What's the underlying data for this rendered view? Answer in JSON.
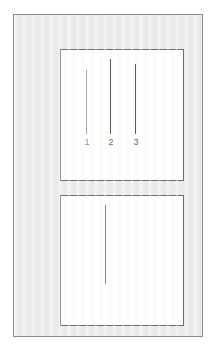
{
  "figure": {
    "canvas": {
      "width": 215,
      "height": 351,
      "background": "#ffffff"
    },
    "frame": {
      "name": "outer-frame",
      "x": 13,
      "y": 14,
      "width": 190,
      "height": 323,
      "fill": "#ecedee",
      "border_color": "#8a8a8a"
    },
    "panels": [
      {
        "id": "top",
        "label": "upper-panel",
        "x": 46,
        "y": 34,
        "width": 124,
        "height": 132,
        "fill": "#ffffff",
        "border_color": "#6e6e6e"
      },
      {
        "id": "bottom",
        "label": "lower-panel",
        "x": 46,
        "y": 180,
        "width": 124,
        "height": 131,
        "fill": "#ffffff",
        "border_color": "#6e6e6e"
      }
    ],
    "marks": {
      "color": "#595959",
      "stroke_width": 1,
      "top_panel": [
        {
          "ref": "1",
          "x": 85,
          "y_top": 69,
          "y_bottom": 133,
          "length": 64
        },
        {
          "ref": "2",
          "x": 109,
          "y_top": 58,
          "y_bottom": 133,
          "length": 75
        },
        {
          "ref": "3",
          "x": 134,
          "y_top": 63,
          "y_bottom": 133,
          "length": 70
        }
      ],
      "bottom_panel": [
        {
          "ref": "",
          "x": 104,
          "y_top": 204,
          "y_bottom": 283,
          "length": 79
        }
      ]
    },
    "labels": [
      {
        "text": "1",
        "x": 85,
        "y": 138,
        "color": "#6b6b6b",
        "font_size": 9
      },
      {
        "text": "2",
        "x": 109,
        "y": 138,
        "color": "#6b6b6b",
        "font_size": 9
      },
      {
        "text": "3",
        "x": 134,
        "y": 138,
        "color": "#6b6b6b",
        "font_size": 9
      }
    ]
  }
}
